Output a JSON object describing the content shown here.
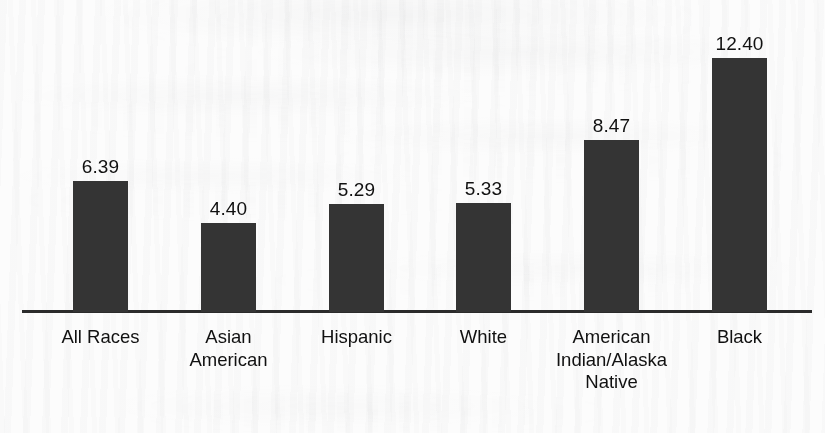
{
  "figure": {
    "background_color": "#fcfcfc",
    "bar_color": "#343434",
    "axis_color": "#2b2b2b",
    "text_color": "#111111"
  },
  "chart_data": {
    "type": "bar",
    "title": "",
    "subtitle": "",
    "xlabel": "",
    "ylabel": "",
    "grid": false,
    "legend": false,
    "orientation": "vertical",
    "ylim": [
      0,
      12.4
    ],
    "categories": [
      "All Races",
      "Asian American",
      "Hispanic",
      "White",
      "American Indian/Alaska Native",
      "Black"
    ],
    "category_lines": [
      [
        "All Races"
      ],
      [
        "Asian",
        "American"
      ],
      [
        "Hispanic"
      ],
      [
        "White"
      ],
      [
        "American",
        "Indian/Alaska",
        "Native"
      ],
      [
        "Black"
      ]
    ],
    "values": [
      6.39,
      4.4,
      5.29,
      5.33,
      8.47,
      12.4
    ],
    "value_labels": [
      "6.39",
      "4.40",
      "5.29",
      "5.33",
      "8.47",
      "12.40"
    ],
    "bar_geometry": [
      {
        "left": 73,
        "width": 55,
        "top": 181,
        "height": 131
      },
      {
        "left": 201,
        "width": 55,
        "top": 223,
        "height": 89
      },
      {
        "left": 329,
        "width": 55,
        "top": 204,
        "height": 108
      },
      {
        "left": 456,
        "width": 55,
        "top": 203,
        "height": 109
      },
      {
        "left": 584,
        "width": 55,
        "top": 140,
        "height": 172
      },
      {
        "left": 712,
        "width": 55,
        "top": 58,
        "height": 254
      }
    ],
    "value_label_tops": [
      157,
      199,
      180,
      179,
      116,
      34
    ],
    "category_label_slots": [
      {
        "left": 10,
        "width": 181
      },
      {
        "left": 138,
        "width": 181
      },
      {
        "left": 266,
        "width": 181
      },
      {
        "left": 393,
        "width": 181
      },
      {
        "left": 521,
        "width": 181
      },
      {
        "left": 649,
        "width": 181
      }
    ]
  }
}
